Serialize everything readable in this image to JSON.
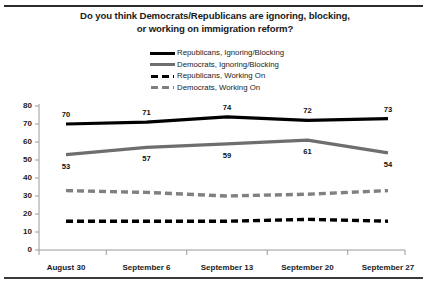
{
  "chart_data": {
    "type": "line",
    "title": "Do you think Democrats/Republicans are ignoring, blocking, or working on immigration reform?",
    "title_line1": "Do you think Democrats/Republicans are ignoring, blocking,",
    "title_line2": "or working on immigration reform?",
    "xlabel": "",
    "ylabel": "",
    "ylim": [
      0,
      80
    ],
    "yticks": [
      80,
      70,
      60,
      50,
      40,
      30,
      20,
      10,
      0
    ],
    "grid": false,
    "legend_position": "top-center",
    "categories": [
      "August 30",
      "September 6",
      "September 13",
      "September 20",
      "September 27"
    ],
    "series": [
      {
        "name": "Republicans, Ignoring/Blocking",
        "style": "solid",
        "color": "#000000",
        "labeled": true,
        "values": [
          70,
          71,
          74,
          72,
          73
        ]
      },
      {
        "name": "Democrats, Ignoring/Blocking",
        "style": "solid",
        "color": "#6e6e6e",
        "labeled": true,
        "values": [
          53,
          57,
          59,
          61,
          54
        ]
      },
      {
        "name": "Republicans, Working On",
        "style": "dashed",
        "color": "#000000",
        "labeled": false,
        "values": [
          16,
          16,
          16,
          17,
          16
        ]
      },
      {
        "name": "Democrats, Working On",
        "style": "dashed",
        "color": "#808080",
        "labeled": false,
        "values": [
          33,
          32,
          30,
          31,
          33
        ]
      }
    ]
  },
  "legend": {
    "items": [
      {
        "label": "Republicans, Ignoring/Blocking",
        "swatch": "sw-solid-black"
      },
      {
        "label": "Democrats, Ignoring/Blocking",
        "swatch": "sw-solid-gray"
      },
      {
        "label": "Republicans, Working On",
        "swatch": "sw-dash-black"
      },
      {
        "label": "Democrats, Working On",
        "swatch": "sw-dash-gray"
      }
    ]
  }
}
